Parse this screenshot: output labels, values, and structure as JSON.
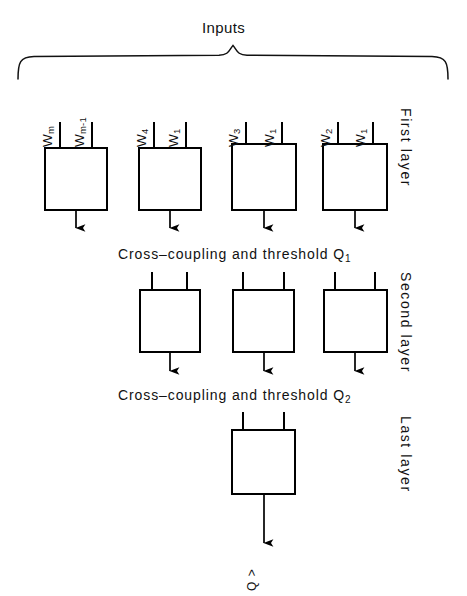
{
  "figure": {
    "title": "Inputs",
    "background_color": "#ffffff",
    "stroke_color": "#000000",
    "width": 467,
    "height": 596
  },
  "input_brace": {
    "name": "inputs-brace"
  },
  "layers": [
    {
      "id": "first-layer",
      "side_label": "First layer",
      "boxes": [
        {
          "id": "first-layer-box-1",
          "inputs": [
            {
              "label": "W",
              "sub": "m"
            },
            {
              "label": "W",
              "sub": "m-1"
            }
          ]
        },
        {
          "id": "first-layer-box-2",
          "inputs": [
            {
              "label": "W",
              "sub": "4"
            },
            {
              "label": "W",
              "sub": "1"
            }
          ]
        },
        {
          "id": "first-layer-box-3",
          "inputs": [
            {
              "label": "W",
              "sub": "3"
            },
            {
              "label": "W",
              "sub": "1"
            }
          ]
        },
        {
          "id": "first-layer-box-4",
          "inputs": [
            {
              "label": "W",
              "sub": "2"
            },
            {
              "label": "W",
              "sub": "1"
            }
          ]
        }
      ]
    },
    {
      "id": "second-layer",
      "side_label": "Second layer",
      "boxes": [
        {
          "id": "second-layer-box-1",
          "inputs": []
        },
        {
          "id": "second-layer-box-2",
          "inputs": []
        },
        {
          "id": "second-layer-box-3",
          "inputs": []
        }
      ]
    },
    {
      "id": "last-layer",
      "side_label": "Last layer",
      "boxes": [
        {
          "id": "last-layer-box-1",
          "inputs": []
        }
      ]
    }
  ],
  "stages": [
    {
      "id": "cross-coupling-1",
      "text": "Cross–coupling and threshold Q",
      "subscript": "1"
    },
    {
      "id": "cross-coupling-2",
      "text": "Cross–coupling and threshold Q",
      "subscript": "2"
    }
  ],
  "output": {
    "id": "network-output",
    "label": "Q",
    "suffix": ">"
  }
}
